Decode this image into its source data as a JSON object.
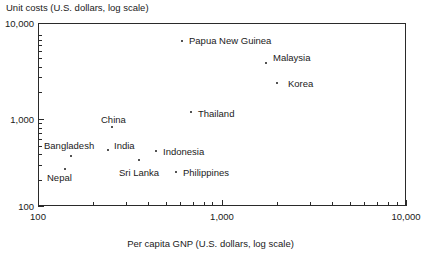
{
  "chart_data": {
    "type": "scatter",
    "title": "",
    "xlabel": "Per capita GNP (U.S. dollars, log scale)",
    "ylabel": "Unit costs (U.S. dollars, log scale)",
    "xscale": "log",
    "yscale": "log",
    "xlim": [
      100,
      10000
    ],
    "ylim": [
      100,
      10000
    ],
    "grid": false,
    "legend": "none",
    "xticks": [
      "100",
      "1,000",
      "10,000"
    ],
    "yticks": [
      "100",
      "1,000",
      "10,000"
    ],
    "points": [
      {
        "label": "Nepal",
        "x": 150,
        "y": 330,
        "px": 65,
        "py": 169,
        "lx": 47,
        "ly": 172
      },
      {
        "label": "Bangladesh",
        "x": 180,
        "y": 460,
        "px": 71,
        "py": 156,
        "lx": 44,
        "ly": 140
      },
      {
        "label": "India",
        "x": 330,
        "y": 490,
        "px": 108,
        "py": 150,
        "lx": 114,
        "ly": 140
      },
      {
        "label": "China",
        "x": 370,
        "y": 900,
        "px": 112,
        "py": 127,
        "lx": 101,
        "ly": 114
      },
      {
        "label": "Sri Lanka",
        "x": 500,
        "y": 410,
        "px": 139,
        "py": 160,
        "lx": 119,
        "ly": 167
      },
      {
        "label": "Indonesia",
        "x": 610,
        "y": 480,
        "px": 156,
        "py": 151,
        "lx": 163,
        "ly": 146
      },
      {
        "label": "Philippines",
        "x": 830,
        "y": 310,
        "px": 176,
        "py": 172,
        "lx": 183,
        "ly": 167
      },
      {
        "label": "Thailand",
        "x": 1150,
        "y": 1250,
        "px": 191,
        "py": 112,
        "lx": 198,
        "ly": 108
      },
      {
        "label": "Papua New Guinea",
        "x": 900,
        "y": 6800,
        "px": 182,
        "py": 41,
        "lx": 189,
        "ly": 35
      },
      {
        "label": "Malaysia",
        "x": 2100,
        "y": 3500,
        "px": 266,
        "py": 63,
        "lx": 273,
        "ly": 52
      },
      {
        "label": "Korea",
        "x": 2600,
        "y": 2200,
        "px": 277,
        "py": 83,
        "lx": 288,
        "ly": 78
      }
    ],
    "x_major_ticks": [
      {
        "value": "100",
        "px": 38
      },
      {
        "value": "1,000",
        "px": 222
      },
      {
        "value": "10,000",
        "px": 406
      }
    ],
    "x_minor_ticks_px": [
      93,
      126,
      148,
      166,
      180,
      193,
      204,
      212,
      277,
      310,
      332,
      350,
      364,
      377,
      388,
      397
    ],
    "y_major_ticks": [
      {
        "value": "100",
        "py": 206
      },
      {
        "value": "1,000",
        "py": 119
      },
      {
        "value": "10,000",
        "py": 23
      }
    ],
    "y_minor_ticks_py": [
      180,
      165,
      154,
      146,
      139,
      133,
      128,
      123,
      92,
      77,
      67,
      58,
      51,
      45,
      40,
      35
    ]
  }
}
